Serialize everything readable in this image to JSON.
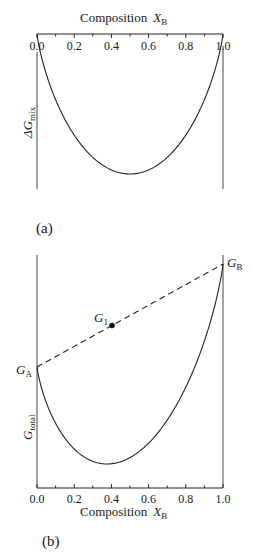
{
  "panel_a": {
    "label": "(a)",
    "x_axis_title": "Composition",
    "x_axis_symbol": "X",
    "x_axis_subscript": "B",
    "y_axis_symbol": "ΔG",
    "y_axis_subscript": "mix",
    "ticks": [
      "0.0",
      "0.2",
      "0.4",
      "0.6",
      "0.8",
      "1.0"
    ]
  },
  "panel_b": {
    "label": "(b)",
    "x_axis_title": "Composition",
    "x_axis_symbol": "X",
    "x_axis_subscript": "B",
    "y_axis_symbol": "G",
    "y_axis_subscript": "total",
    "ticks": [
      "0.0",
      "0.2",
      "0.4",
      "0.6",
      "0.8",
      "1.0"
    ],
    "point_labels": {
      "GA": {
        "symbol": "G",
        "sub": "A"
      },
      "GB": {
        "symbol": "G",
        "sub": "B"
      },
      "G1": {
        "symbol": "G",
        "sub": "1"
      }
    }
  },
  "chart_data": [
    {
      "type": "line",
      "title": "(a)",
      "xlabel": "Composition X_B",
      "ylabel": "ΔG_mix",
      "xlim": [
        0.0,
        1.0
      ],
      "x_ticks": [
        0.0,
        0.2,
        0.4,
        0.6,
        0.8,
        1.0
      ],
      "x_axis_position": "top",
      "series": [
        {
          "name": "ΔG_mix",
          "description": "ideal mixing curve, zero at X_B=0 and 1, minimum at X_B=0.5"
        }
      ],
      "minimum_x": 0.5
    },
    {
      "type": "line",
      "title": "(b)",
      "xlabel": "Composition X_B",
      "ylabel": "G_total",
      "xlim": [
        0.0,
        1.0
      ],
      "x_ticks": [
        0.0,
        0.2,
        0.4,
        0.6,
        0.8,
        1.0
      ],
      "x_axis_position": "bottom",
      "series": [
        {
          "name": "G_total",
          "description": "free energy of solution curve from G_A to G_B, minimum near X_B≈0.37"
        },
        {
          "name": "G_A–G_B tie line",
          "style": "dashed",
          "x": [
            0.0,
            1.0
          ]
        }
      ],
      "points": [
        {
          "label": "G_A",
          "x": 0.0
        },
        {
          "label": "G_B",
          "x": 1.0
        },
        {
          "label": "G_1",
          "x": 0.4,
          "marker": "filled-circle",
          "on": "dashed line"
        }
      ],
      "minimum_x": 0.37
    }
  ]
}
